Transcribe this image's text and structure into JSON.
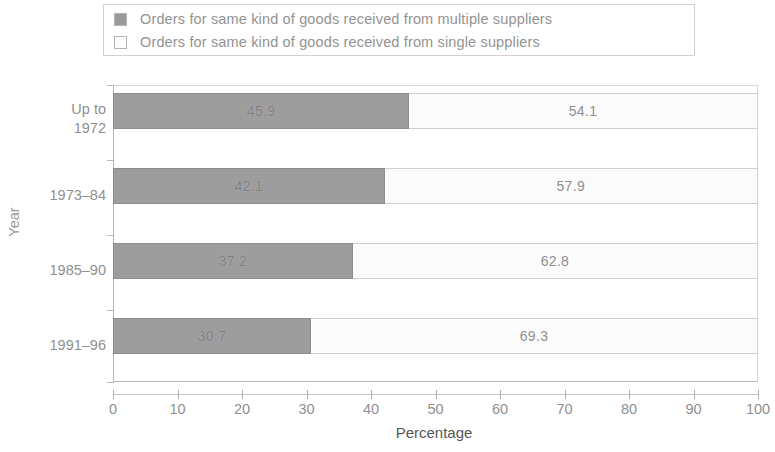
{
  "chart_data": {
    "type": "bar",
    "subtype": "horizontal-stacked-100",
    "title": "",
    "xlabel": "Percentage",
    "ylabel": "Year",
    "xlim": [
      0,
      100
    ],
    "xticks": [
      0,
      10,
      20,
      30,
      40,
      50,
      60,
      70,
      80,
      90,
      100
    ],
    "xtick_labels": [
      "0",
      "10",
      "20",
      "30",
      "40",
      "50",
      "60",
      "70",
      "80",
      "90",
      "100"
    ],
    "grid": false,
    "legend_position": "top",
    "categories": [
      "Up to 1972",
      "1973-84",
      "1985-90",
      "1991-96"
    ],
    "category_label_lines": [
      [
        "Up to",
        "1972"
      ],
      [
        "1973–84"
      ],
      [
        "1985–90"
      ],
      [
        "1991–96"
      ]
    ],
    "series": [
      {
        "name": "Orders for same kind of goods received from multiple suppliers",
        "key": "multiple",
        "color": "#9d9d9d",
        "values": [
          45.9,
          42.1,
          37.2,
          30.7
        ],
        "value_labels": [
          "45.9",
          "42.1",
          "37.2",
          "30.7"
        ]
      },
      {
        "name": "Orders for same kind of goods received from single suppliers",
        "key": "single",
        "color": "#fbfbfb",
        "values": [
          54.1,
          57.9,
          62.8,
          69.3
        ],
        "value_labels": [
          "54.1",
          "57.9",
          "62.8",
          "69.3"
        ]
      }
    ]
  },
  "legend": {
    "entries": [
      {
        "swatch": "filled-dark-gray-square",
        "label": "Orders for same kind of goods received from multiple suppliers"
      },
      {
        "swatch": "outlined-white-square",
        "label": "Orders for same kind of goods received from single suppliers"
      }
    ]
  },
  "axes": {
    "y_title": "Year",
    "x_title": "Percentage"
  }
}
